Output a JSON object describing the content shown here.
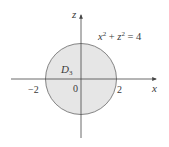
{
  "diagram": {
    "region": {
      "label": "D",
      "subscript": "3",
      "fill": "#e6e6e6",
      "stroke": "#555555"
    },
    "equation": {
      "base1": "x",
      "sup1": "2",
      "plus": " + ",
      "base2": "z",
      "sup2": "2",
      "rhs": " = 4"
    },
    "axes": {
      "horizontal": "x",
      "vertical": "z",
      "color": "#444444"
    },
    "ticks": {
      "left": "−2",
      "origin": "0",
      "right": "2"
    }
  }
}
